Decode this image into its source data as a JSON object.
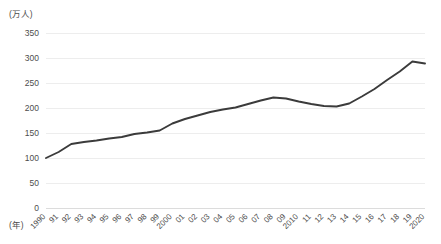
{
  "chart_data": {
    "type": "line",
    "title": "",
    "subtitle": "",
    "xlabel": "(年)",
    "ylabel": "(万人)",
    "ylim": [
      0,
      350
    ],
    "ytick_step": 50,
    "yticks": [
      0,
      50,
      100,
      150,
      200,
      250,
      300,
      350
    ],
    "ytick_labels": [
      "0",
      "50",
      "100",
      "150",
      "200",
      "250",
      "300",
      "350"
    ],
    "grid": true,
    "legend": false,
    "legend_position": "none",
    "categories": [
      "1990",
      "91",
      "92",
      "93",
      "94",
      "95",
      "96",
      "97",
      "98",
      "99",
      "2000",
      "01",
      "02",
      "03",
      "04",
      "05",
      "06",
      "07",
      "08",
      "09",
      "2010",
      "11",
      "12",
      "13",
      "14",
      "15",
      "16",
      "17",
      "18",
      "19",
      "2020"
    ],
    "x": [
      1990,
      1991,
      1992,
      1993,
      1994,
      1995,
      1996,
      1997,
      1998,
      1999,
      2000,
      2001,
      2002,
      2003,
      2004,
      2005,
      2006,
      2007,
      2008,
      2009,
      2010,
      2011,
      2012,
      2013,
      2014,
      2015,
      2016,
      2017,
      2018,
      2019,
      2020
    ],
    "values": [
      100,
      112,
      128,
      132,
      135,
      139,
      142,
      148,
      151,
      155,
      169,
      178,
      185,
      192,
      197,
      201,
      208,
      215,
      221,
      219,
      213,
      208,
      204,
      203,
      209,
      223,
      238,
      256,
      273,
      293,
      289
    ],
    "series": [
      {
        "name": "",
        "color": "#3b3b3b",
        "values": [
          100,
          112,
          128,
          132,
          135,
          139,
          142,
          148,
          151,
          155,
          169,
          178,
          185,
          192,
          197,
          201,
          208,
          215,
          221,
          219,
          213,
          208,
          204,
          203,
          209,
          223,
          238,
          256,
          273,
          293,
          289
        ]
      }
    ],
    "annotations": []
  },
  "axes": {
    "unit_label": "(万人)",
    "year_label": "(年)"
  },
  "colors": {
    "line": "#3b3b3b",
    "grid": "#e8e8e8",
    "text": "#4d4d4d",
    "background": "#ffffff"
  }
}
